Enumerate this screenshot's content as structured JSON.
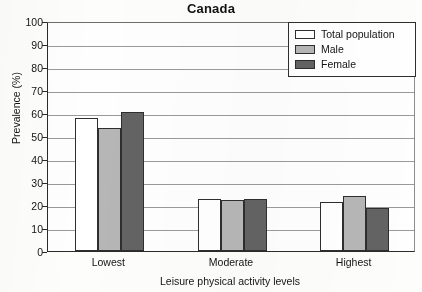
{
  "chart_data": {
    "type": "bar",
    "title": "Canada",
    "xlabel": "Leisure physical activity levels",
    "ylabel": "Prevalence (%)",
    "categories": [
      "Lowest",
      "Moderate",
      "Highest"
    ],
    "series": [
      {
        "name": "Total population",
        "color": "#ffffff",
        "values": [
          58,
          22.5,
          21.5
        ]
      },
      {
        "name": "Male",
        "color": "#b6b6b6",
        "values": [
          53.5,
          22,
          24
        ]
      },
      {
        "name": "Female",
        "color": "#636363",
        "values": [
          60.5,
          22.5,
          18.5
        ]
      }
    ],
    "ylim": [
      0,
      100
    ],
    "ytick_step": 10,
    "yticks": [
      0,
      10,
      20,
      30,
      40,
      50,
      60,
      70,
      80,
      90,
      100
    ],
    "ytick_labels": [
      "0",
      "10",
      "20",
      "30",
      "40",
      "50",
      "60",
      "70",
      "80",
      "90",
      "100"
    ],
    "grid": true,
    "legend_position": "top-right"
  },
  "legend": {
    "entries": [
      {
        "label": "Total population"
      },
      {
        "label": "Male"
      },
      {
        "label": "Female"
      }
    ]
  }
}
